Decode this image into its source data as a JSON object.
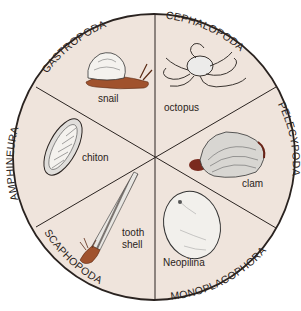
{
  "colors": {
    "background": "#ffffff",
    "disc": "#efe4dc",
    "outline": "#2a2320",
    "snail_body": "#a0522d",
    "shell": "#f4f2ee"
  },
  "sectors": [
    {
      "class_name": "GASTROPODA",
      "example": "snail",
      "icon": "snail-icon"
    },
    {
      "class_name": "CEPHALOPODA",
      "example": "octopus",
      "icon": "octopus-icon"
    },
    {
      "class_name": "PELECYPODA",
      "example": "clam",
      "icon": "clam-icon"
    },
    {
      "class_name": "MONOPLACOPHORA",
      "example": "Neopilina",
      "icon": "neopilina-icon"
    },
    {
      "class_name": "SCAPHOPODA",
      "example_line1": "tooth",
      "example_line2": "shell",
      "icon": "tooth-shell-icon"
    },
    {
      "class_name": "AMPHINEURA",
      "example": "chiton",
      "icon": "chiton-icon"
    }
  ]
}
